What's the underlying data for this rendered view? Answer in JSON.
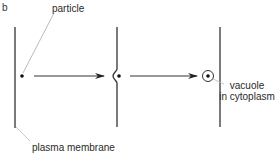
{
  "panel_label": "b",
  "labels": {
    "particle": "particle",
    "plasma_membrane": "plasma membrane",
    "vacuole_line1": "vacuole",
    "vacuole_line2": "in cytoplasm"
  },
  "stages": [
    {
      "name": "particle-outside-membrane",
      "description": "particle adjacent to flat plasma membrane"
    },
    {
      "name": "membrane-invaginating",
      "description": "membrane folds around particle"
    },
    {
      "name": "vacuole-formed",
      "description": "particle enclosed in vacuole in cytoplasm"
    }
  ],
  "colors": {
    "line": "#333333",
    "leader": "#999999",
    "text": "#2a2a2a"
  }
}
